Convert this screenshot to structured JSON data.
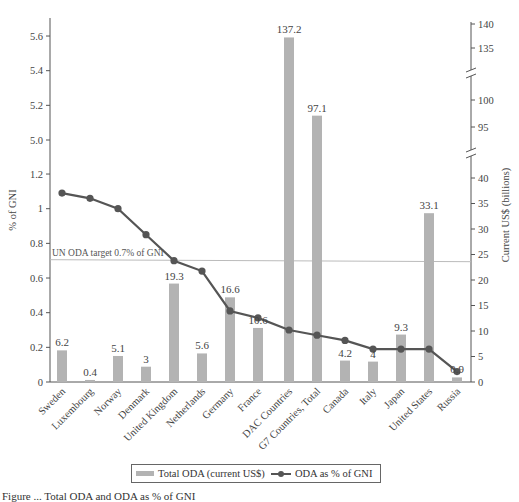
{
  "chart_data": {
    "type": "bar+line",
    "title": "",
    "categories": [
      "Sweden",
      "Luxembourg",
      "Norway",
      "Denmark",
      "United Kingdom",
      "Netherlands",
      "Germany",
      "France",
      "DAC Countries",
      "G7 Countries, Total",
      "Canada",
      "Italy",
      "Japan",
      "United States",
      "Russia"
    ],
    "series": [
      {
        "name": "Total ODA (current US$)",
        "type": "bar",
        "axis": "right",
        "color": "#b3b3b3",
        "values": [
          6.2,
          0.4,
          5.1,
          3,
          19.3,
          5.6,
          16.6,
          10.6,
          137.2,
          97.1,
          4.2,
          4,
          9.3,
          33.1,
          0.9
        ],
        "data_labels": [
          "6.2",
          "0.4",
          "5.1",
          "3",
          "19.3",
          "5.6",
          "16.6",
          "10.6",
          "137.2",
          "97.1",
          "4.2",
          "4",
          "9.3",
          "33.1",
          "0.9"
        ]
      },
      {
        "name": "ODA as % of GNI",
        "type": "line",
        "axis": "left",
        "color": "#555555",
        "values": [
          1.09,
          1.06,
          1.0,
          0.85,
          0.7,
          0.64,
          0.41,
          0.37,
          0.3,
          0.27,
          0.24,
          0.19,
          0.19,
          0.19,
          0.06
        ]
      }
    ],
    "reference_line": {
      "label": "UN ODA target 0.7% of GNI",
      "value": 0.7,
      "axis": "left",
      "color": "#bbbbbb"
    },
    "ylabel": "% of GNI",
    "ylabel_right": "Current US$ (billions)",
    "xlabel": "",
    "left_axis": {
      "ticks": [
        "0",
        "0.2",
        "0.4",
        "0.6",
        "0.8",
        "1",
        "1.2",
        "5.0",
        "5.2",
        "5.4",
        "5.6"
      ],
      "segments": [
        {
          "range": [
            0,
            1.2
          ]
        },
        {
          "range": [
            5.0,
            5.6
          ]
        }
      ]
    },
    "right_axis": {
      "ticks": [
        "0",
        "5",
        "10",
        "15",
        "20",
        "25",
        "30",
        "35",
        "40",
        "95",
        "100",
        "135",
        "140"
      ],
      "broken": true,
      "segments": [
        {
          "range": [
            0,
            40
          ]
        },
        {
          "range": [
            95,
            100
          ]
        },
        {
          "range": [
            135,
            140
          ]
        }
      ]
    },
    "grid": false,
    "legend_position": "bottom"
  },
  "legend": {
    "bar_label": "Total ODA (current US$)",
    "line_label": "ODA as % of GNI"
  },
  "caption": "Figure ... Total ODA and ODA as % of GNI"
}
